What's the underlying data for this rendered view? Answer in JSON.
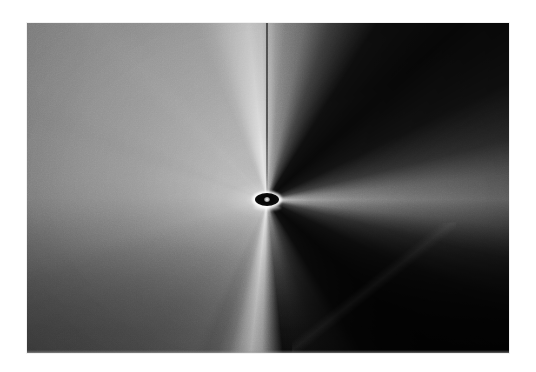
{
  "page": {
    "background_color": "#ffffff",
    "width": 536,
    "height": 372
  },
  "plate": {
    "label": "grayscale radial field exposure",
    "left": 27,
    "top": 23,
    "width": 482,
    "height": 330,
    "border_color": "#f2f2f2",
    "background_color": "#8a8a8a"
  },
  "chart_data": {
    "type": "heatmap",
    "title": "",
    "subtitle": "",
    "xlabel": "",
    "ylabel": "",
    "colormap": "grayscale",
    "grid": false,
    "legend": "none",
    "xlim": [
      0,
      482
    ],
    "ylim": [
      0,
      330
    ],
    "center": {
      "x_frac": 0.498,
      "y_frac": 0.536
    },
    "features": [
      {
        "name": "upper-field",
        "description": "broad mid-gray field filling the top half",
        "tone_hex": "#8e8e8e",
        "intensity": 0.56
      },
      {
        "name": "core-dark-ellipse",
        "description": "small dark elliptical occulting disc at the convergence point",
        "tone_hex": "#060606",
        "intensity": 0.02,
        "width_px": 24,
        "height_px": 13
      },
      {
        "name": "core-bright-rim",
        "description": "white rim encircling the dark core",
        "tone_hex": "#ffffff",
        "intensity": 0.98
      },
      {
        "name": "vertical-dark-line",
        "description": "thin dark vertical streak from the top edge down to the core",
        "tone_hex": "#282828",
        "intensity": 0.16,
        "width_px": 2
      },
      {
        "name": "lower-left-wing",
        "description": "large dark lobe occupying the lower-left quadrant",
        "tone_hex": "#050505",
        "intensity": 0.02
      },
      {
        "name": "lower-right-wing",
        "description": "large dark lobe occupying the lower-right quadrant",
        "tone_hex": "#050505",
        "intensity": 0.02
      },
      {
        "name": "downward-bright-cone",
        "description": "bright wedge of light spreading downward from the core to the bottom edge",
        "tone_hex": "#e8e8e8",
        "intensity": 0.91
      },
      {
        "name": "radial-spokes",
        "description": "faint alternating light and dark radial streaks across the upper field",
        "tone_hex": "#9a9a9a",
        "intensity": 0.6
      }
    ],
    "intensity_scale": {
      "min": 0.0,
      "max": 1.0,
      "min_hex": "#000000",
      "max_hex": "#ffffff"
    }
  }
}
